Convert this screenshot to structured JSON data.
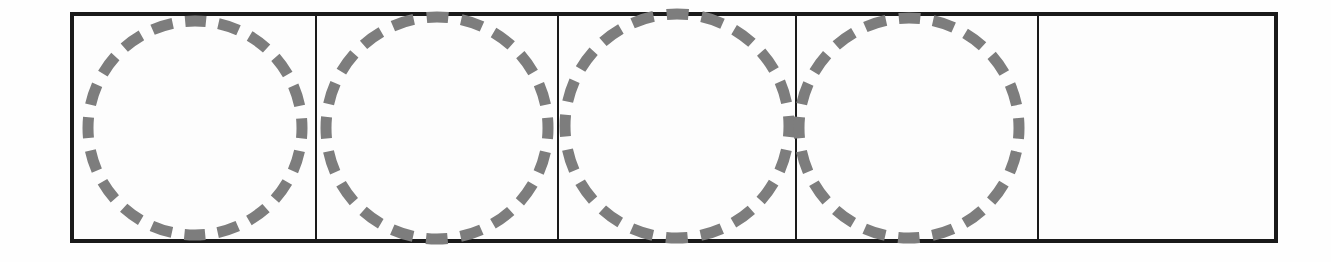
{
  "figure": {
    "background_color": "#fefefe",
    "frame": {
      "border_color": "#1a1a1a",
      "border_width_px": 4,
      "divider_color": "#1a1a1a",
      "divider_width_px": 2,
      "fill_color": "#fdfdfd",
      "x": 70,
      "y": 12,
      "width": 1208,
      "height": 231
    },
    "shape_style": {
      "stroke_color": "#7d7d7d",
      "stroke_width_px": 11,
      "dash_length_px": 22,
      "gap_length_px": 13,
      "dash_count": 20
    },
    "cells": [
      {
        "index": 1,
        "name": "cell-1",
        "width_px": 243,
        "shape": "dashed-circle",
        "shape_diameter_px": 214,
        "shape_offset_x_px": 0,
        "shape_offset_y_px": 0,
        "empty": false
      },
      {
        "index": 2,
        "name": "cell-2",
        "width_px": 242,
        "shape": "dashed-circle",
        "shape_diameter_px": 222,
        "shape_offset_x_px": 0,
        "shape_offset_y_px": 0,
        "empty": false
      },
      {
        "index": 3,
        "name": "cell-3",
        "width_px": 238,
        "shape": "dashed-circle",
        "shape_diameter_px": 224,
        "shape_offset_x_px": 0,
        "shape_offset_y_px": -2,
        "empty": false
      },
      {
        "index": 4,
        "name": "cell-4",
        "width_px": 242,
        "shape": "dashed-circle",
        "shape_diameter_px": 220,
        "shape_offset_x_px": -8,
        "shape_offset_y_px": 0,
        "empty": false
      },
      {
        "index": 5,
        "name": "cell-5",
        "width_px": 235,
        "shape": "none",
        "shape_diameter_px": 0,
        "shape_offset_x_px": 0,
        "shape_offset_y_px": 0,
        "empty": true
      }
    ]
  },
  "chart_data": {
    "type": "table",
    "title": "",
    "xlabel": "",
    "ylabel": "",
    "categories": [
      "cell-1",
      "cell-2",
      "cell-3",
      "cell-4",
      "cell-5"
    ],
    "values": [
      1,
      1,
      1,
      1,
      0
    ],
    "series": [
      {
        "name": "dashed circles per cell",
        "values": [
          1,
          1,
          1,
          1,
          0
        ]
      }
    ],
    "legend": [],
    "grid": false
  }
}
